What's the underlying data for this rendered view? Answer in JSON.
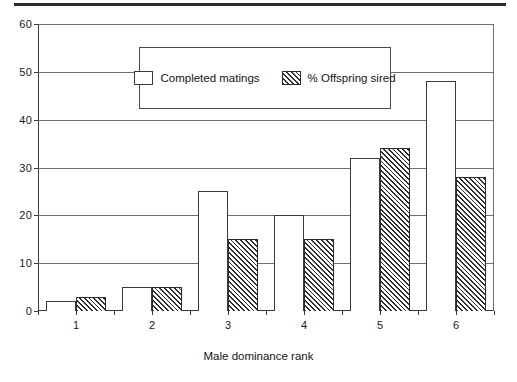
{
  "figure": {
    "has_top_rule": true,
    "background_color": "#ffffff",
    "axis_color": "#3a3a3a",
    "grid_color": "#6e6e6e"
  },
  "legend": {
    "position": "upper-center",
    "entries": [
      {
        "label": "Completed matings",
        "swatch": "open-white-rectangle"
      },
      {
        "label": "% Offspring sired",
        "swatch": "diagonal-hatched-rectangle"
      }
    ]
  },
  "chart_data": {
    "type": "bar",
    "title": "",
    "subtitle": "",
    "xlabel": "Male dominance rank",
    "ylabel": "",
    "categories": [
      "1",
      "2",
      "3",
      "4",
      "5",
      "6"
    ],
    "series": [
      {
        "name": "Completed matings",
        "values": [
          2,
          5,
          25,
          20,
          32,
          48
        ],
        "fill": "white",
        "edge_color": "#3a3a3a"
      },
      {
        "name": "% Offspring sired",
        "values": [
          3,
          5,
          15,
          15,
          34,
          28
        ],
        "fill": "diagonal-hatch",
        "edge_color": "#2b2b2b"
      }
    ],
    "ylim": [
      0,
      60
    ],
    "yticks": [
      0,
      10,
      20,
      30,
      40,
      50,
      60
    ],
    "ytick_labels": [
      "0",
      "10",
      "20",
      "30",
      "40",
      "50",
      "60"
    ],
    "xtick_labels": [
      "1",
      "2",
      "3",
      "4",
      "5",
      "6"
    ],
    "grid": true,
    "grid_axis": "y",
    "legend_position": "upper-center"
  }
}
